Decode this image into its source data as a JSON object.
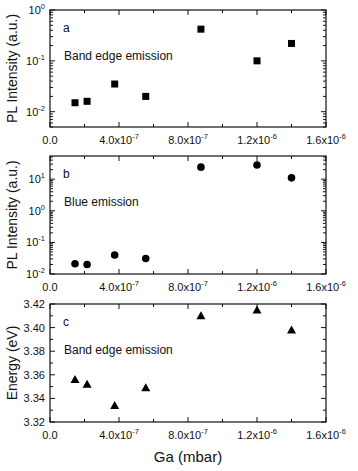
{
  "figure": {
    "xlabel": "Ga (mbar)",
    "x_ticks": [
      0,
      4e-07,
      8e-07,
      1.2e-06,
      1.6e-06
    ],
    "x_tick_labels": [
      {
        "base": "0.0",
        "exp": ""
      },
      {
        "base": "4.0x10",
        "exp": "-7"
      },
      {
        "base": "8.0x10",
        "exp": "-7"
      },
      {
        "base": "1.2x10",
        "exp": "-6"
      },
      {
        "base": "1.6x10",
        "exp": "-6"
      }
    ],
    "xlim": [
      0,
      1.6e-06
    ],
    "colors": {
      "axis": "#111111",
      "marker": "#000000",
      "background": "#ffffff"
    }
  },
  "chart_data": [
    {
      "type": "scatter",
      "panel_label": "a",
      "annotation": "Band edge emission",
      "title": "",
      "xlabel": "Ga (mbar)",
      "ylabel": "PL Intensity (a.u.)",
      "yscale": "log",
      "ylim": [
        0.005,
        1
      ],
      "y_ticks": [
        {
          "base": "10",
          "exp": "0",
          "value": 1
        },
        {
          "base": "10",
          "exp": "-1",
          "value": 0.1
        },
        {
          "base": "10",
          "exp": "-2",
          "value": 0.01
        }
      ],
      "marker": "square",
      "grid": false,
      "x": [
        1.45e-07,
        2.15e-07,
        3.75e-07,
        5.55e-07,
        8.75e-07,
        1.2e-06,
        1.4e-06
      ],
      "y": [
        0.015,
        0.016,
        0.035,
        0.02,
        0.42,
        0.1,
        0.22
      ]
    },
    {
      "type": "scatter",
      "panel_label": "b",
      "annotation": "Blue emission",
      "title": "",
      "xlabel": "Ga (mbar)",
      "ylabel": "PL Intensity (a.u.)",
      "yscale": "log",
      "ylim": [
        0.01,
        54
      ],
      "y_ticks": [
        {
          "base": "10",
          "exp": "1",
          "value": 10
        },
        {
          "base": "10",
          "exp": "0",
          "value": 1
        },
        {
          "base": "10",
          "exp": "-1",
          "value": 0.1
        },
        {
          "base": "10",
          "exp": "-2",
          "value": 0.01
        }
      ],
      "marker": "circle",
      "grid": false,
      "x": [
        1.45e-07,
        2.15e-07,
        3.75e-07,
        5.55e-07,
        8.75e-07,
        1.2e-06,
        1.4e-06
      ],
      "y": [
        0.021,
        0.02,
        0.04,
        0.031,
        24,
        28,
        11
      ]
    },
    {
      "type": "scatter",
      "panel_label": "c",
      "annotation": "Band edge emission",
      "title": "",
      "xlabel": "Ga (mbar)",
      "ylabel": "Energy (eV)",
      "yscale": "linear",
      "ylim": [
        3.32,
        3.42
      ],
      "y_ticks": [
        {
          "base": "3.42",
          "exp": "",
          "value": 3.42
        },
        {
          "base": "3.40",
          "exp": "",
          "value": 3.4
        },
        {
          "base": "3.38",
          "exp": "",
          "value": 3.38
        },
        {
          "base": "3.36",
          "exp": "",
          "value": 3.36
        },
        {
          "base": "3.34",
          "exp": "",
          "value": 3.34
        },
        {
          "base": "3.32",
          "exp": "",
          "value": 3.32
        }
      ],
      "marker": "triangle",
      "grid": false,
      "x": [
        1.45e-07,
        2.15e-07,
        3.75e-07,
        5.55e-07,
        8.75e-07,
        1.2e-06,
        1.4e-06
      ],
      "y": [
        3.356,
        3.352,
        3.334,
        3.349,
        3.41,
        3.415,
        3.398
      ]
    }
  ]
}
